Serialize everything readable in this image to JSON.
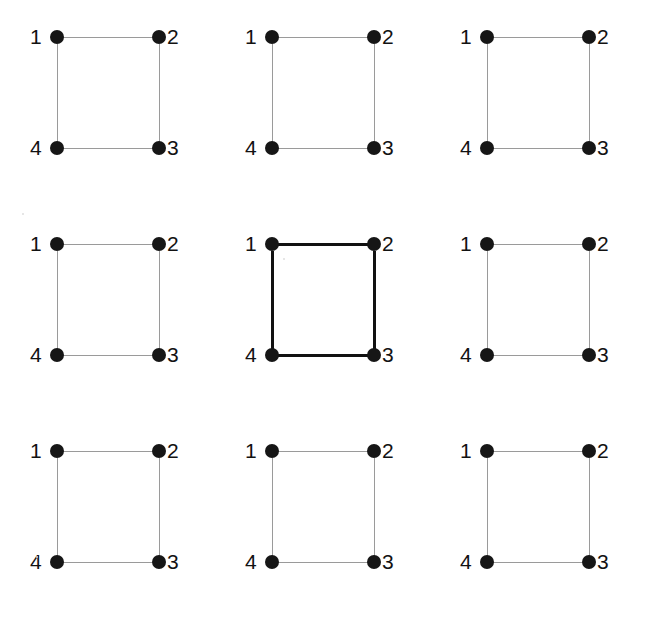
{
  "figure": {
    "background_color": "#ffffff",
    "grid_rows": 3,
    "grid_cols": 3,
    "node_color": "#161616",
    "edge_color_normal": "#9a9a9a",
    "edge_color_highlight": "#111111"
  },
  "node_labels": {
    "n1": "1",
    "n2": "2",
    "n3": "3",
    "n4": "4"
  },
  "cells": [
    {
      "id": "cell-r1c1",
      "row": 1,
      "col": 1,
      "highlighted": false,
      "labels": {
        "n1": "1",
        "n2": "2",
        "n3": "3",
        "n4": "4"
      }
    },
    {
      "id": "cell-r1c2",
      "row": 1,
      "col": 2,
      "highlighted": false,
      "labels": {
        "n1": "1",
        "n2": "2",
        "n3": "3",
        "n4": "4"
      }
    },
    {
      "id": "cell-r1c3",
      "row": 1,
      "col": 3,
      "highlighted": false,
      "labels": {
        "n1": "1",
        "n2": "2",
        "n3": "3",
        "n4": "4"
      }
    },
    {
      "id": "cell-r2c1",
      "row": 2,
      "col": 1,
      "highlighted": false,
      "labels": {
        "n1": "1",
        "n2": "2",
        "n3": "3",
        "n4": "4"
      }
    },
    {
      "id": "cell-r2c2",
      "row": 2,
      "col": 2,
      "highlighted": true,
      "labels": {
        "n1": "1",
        "n2": "2",
        "n3": "3",
        "n4": "4"
      }
    },
    {
      "id": "cell-r2c3",
      "row": 2,
      "col": 3,
      "highlighted": false,
      "labels": {
        "n1": "1",
        "n2": "2",
        "n3": "3",
        "n4": "4"
      }
    },
    {
      "id": "cell-r3c1",
      "row": 3,
      "col": 1,
      "highlighted": false,
      "labels": {
        "n1": "1",
        "n2": "2",
        "n3": "3",
        "n4": "4"
      }
    },
    {
      "id": "cell-r3c2",
      "row": 3,
      "col": 2,
      "highlighted": false,
      "labels": {
        "n1": "1",
        "n2": "2",
        "n3": "3",
        "n4": "4"
      }
    },
    {
      "id": "cell-r3c3",
      "row": 3,
      "col": 3,
      "highlighted": false,
      "labels": {
        "n1": "1",
        "n2": "2",
        "n3": "3",
        "n4": "4"
      }
    }
  ],
  "chart_data": {
    "type": "diagram",
    "title": "",
    "nodes": [
      "1",
      "2",
      "3",
      "4"
    ],
    "edges": [
      [
        "1",
        "2"
      ],
      [
        "2",
        "3"
      ],
      [
        "3",
        "4"
      ],
      [
        "4",
        "1"
      ]
    ],
    "node_positions": {
      "1": [
        0,
        1
      ],
      "2": [
        1,
        1
      ],
      "3": [
        1,
        0
      ],
      "4": [
        0,
        0
      ]
    },
    "panels": 9,
    "highlighted_panel_index": 4,
    "panel_layout": [
      3,
      3
    ]
  }
}
